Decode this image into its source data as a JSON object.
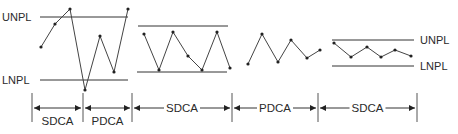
{
  "diagram": {
    "limit_labels": {
      "left_upper": "UNPL",
      "left_lower": "LNPL",
      "right_upper": "UNPL",
      "right_lower": "LNPL"
    },
    "phases": [
      {
        "label": "SDCA",
        "x1": 32,
        "x2": 83
      },
      {
        "label": "PDCA",
        "x1": 83,
        "x2": 132
      },
      {
        "label": "SDCA",
        "x1": 132,
        "x2": 232
      },
      {
        "label": "PDCA",
        "x1": 232,
        "x2": 318
      },
      {
        "label": "SDCA",
        "x1": 318,
        "x2": 417
      }
    ],
    "sections": [
      {
        "name": "initial-unstable",
        "limits": {
          "upper": {
            "y": 17,
            "x1": 40,
            "x2": 128
          },
          "lower": {
            "y": 80,
            "x1": 40,
            "x2": 128
          }
        },
        "points": [
          [
            41,
            47
          ],
          [
            55,
            24
          ],
          [
            70,
            9
          ],
          [
            85,
            90
          ],
          [
            100,
            36
          ],
          [
            114,
            72
          ],
          [
            128,
            9
          ]
        ]
      },
      {
        "name": "standardized",
        "limits": {
          "upper": {
            "y": 26,
            "x1": 138,
            "x2": 228
          },
          "lower": {
            "y": 72,
            "x1": 137,
            "x2": 227
          }
        },
        "points": [
          [
            144,
            34
          ],
          [
            159,
            70
          ],
          [
            173,
            32
          ],
          [
            188,
            56
          ],
          [
            202,
            70
          ],
          [
            217,
            32
          ],
          [
            230,
            68
          ]
        ]
      },
      {
        "name": "improvement",
        "limits": null,
        "points": [
          [
            248,
            64
          ],
          [
            262,
            34
          ],
          [
            278,
            62
          ],
          [
            291,
            40
          ],
          [
            307,
            58
          ],
          [
            320,
            50
          ]
        ]
      },
      {
        "name": "new-standard",
        "limits": {
          "upper": {
            "y": 40,
            "x1": 332,
            "x2": 414
          },
          "lower": {
            "y": 66,
            "x1": 332,
            "x2": 414
          }
        },
        "points": [
          [
            334,
            43
          ],
          [
            351,
            57
          ],
          [
            367,
            47
          ],
          [
            381,
            57
          ],
          [
            395,
            50
          ],
          [
            411,
            56
          ]
        ]
      }
    ]
  }
}
